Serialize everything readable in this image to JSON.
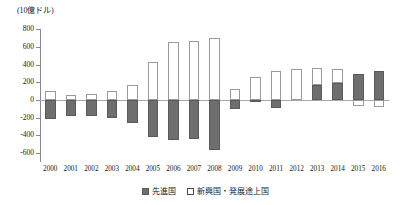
{
  "chart_data": {
    "type": "bar",
    "title": "",
    "unit_label": "(10億ドル)",
    "xlabel": "",
    "ylabel": "",
    "ylim": [
      -700,
      800
    ],
    "yticks": [
      800,
      600,
      400,
      200,
      0,
      -200,
      -400,
      -600
    ],
    "ytick_labels": [
      "800",
      "600",
      "400",
      "200",
      "0",
      "-200",
      "-400",
      "-600"
    ],
    "grid": false,
    "stacked": true,
    "legend_position": "bottom",
    "categories": [
      "2000",
      "2001",
      "2002",
      "2003",
      "2004",
      "2005",
      "2006",
      "2007",
      "2008",
      "2009",
      "2010",
      "2011",
      "2012",
      "2013",
      "2014",
      "2015",
      "2016"
    ],
    "series": [
      {
        "name": "先進国",
        "color": "#6e6e6e",
        "values": [
          -220,
          -180,
          -180,
          -205,
          -265,
          -415,
          -450,
          -440,
          -560,
          -105,
          -15,
          -90,
          0,
          170,
          190,
          290,
          330
        ]
      },
      {
        "name": "新興国・発展途上国",
        "color": "#ffffff",
        "values": [
          105,
          60,
          70,
          100,
          165,
          425,
          655,
          660,
          695,
          120,
          255,
          325,
          355,
          195,
          165,
          -65,
          -75
        ]
      }
    ]
  },
  "legend": {
    "items": [
      {
        "label": "先進国",
        "swatch": "filled-square"
      },
      {
        "label": "新興国・発展途上国",
        "swatch": "hollow-square"
      }
    ]
  }
}
